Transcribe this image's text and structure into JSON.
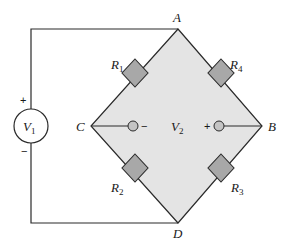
{
  "diagram": {
    "type": "wheatstone-bridge-circuit",
    "nodes": [
      {
        "id": "A",
        "label": "A"
      },
      {
        "id": "B",
        "label": "B"
      },
      {
        "id": "C",
        "label": "C"
      },
      {
        "id": "D",
        "label": "D"
      }
    ],
    "source": {
      "label": "V",
      "sub": "1",
      "plus": "+",
      "minus": "−"
    },
    "meter": {
      "label": "V",
      "sub": "2",
      "plus": "+",
      "minus": "−"
    },
    "resistors": [
      {
        "id": "R1",
        "label": "R",
        "sub": "1",
        "between": [
          "A",
          "C"
        ]
      },
      {
        "id": "R4",
        "label": "R",
        "sub": "4",
        "between": [
          "A",
          "B"
        ]
      },
      {
        "id": "R2",
        "label": "R",
        "sub": "2",
        "between": [
          "C",
          "D"
        ]
      },
      {
        "id": "R3",
        "label": "R",
        "sub": "3",
        "between": [
          "B",
          "D"
        ]
      }
    ],
    "colors": {
      "bridge_fill": "#e4e4e4",
      "resistor_fill": "#a8a8a8",
      "probe_fill": "#c4c4c4",
      "wire": "#2a2a2a"
    }
  }
}
